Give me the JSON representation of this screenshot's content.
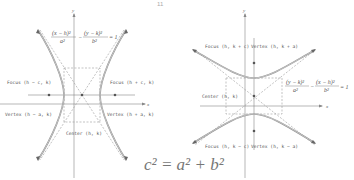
{
  "page_marker": "11",
  "left_diagram": {
    "orientation": "horizontal-transverse-axis",
    "equation": {
      "numerator_left": "(x − h)²",
      "denominator_left": "a²",
      "minus": "−",
      "numerator_right": "(y − k)²",
      "denominator_right": "b²",
      "equals": "= 1"
    },
    "axis_labels": {
      "x": "x",
      "y": "y"
    },
    "labels": {
      "focus_left": "Focus (h − c, k)",
      "focus_right": "Focus (h + c, k)",
      "vertex_left": "Vertex (h − a, k)",
      "vertex_right": "Vertex (h + a, k)",
      "center": "Center (h, k)"
    }
  },
  "right_diagram": {
    "orientation": "vertical-transverse-axis",
    "equation": {
      "numerator_left": "(y − k)²",
      "denominator_left": "a²",
      "minus": "−",
      "numerator_right": "(x − h)²",
      "denominator_right": "b²",
      "equals": "= 1"
    },
    "axis_labels": {
      "x": "x",
      "y": "y"
    },
    "labels": {
      "focus_top": "Focus (h, k + c)",
      "vertex_top": "Vertex (h, k + a)",
      "focus_bottom": "Focus (h, k − c)",
      "vertex_bottom": "Vertex (h, k − a)",
      "center": "Center (h, k)"
    }
  },
  "relation": "c² = a² + b²"
}
